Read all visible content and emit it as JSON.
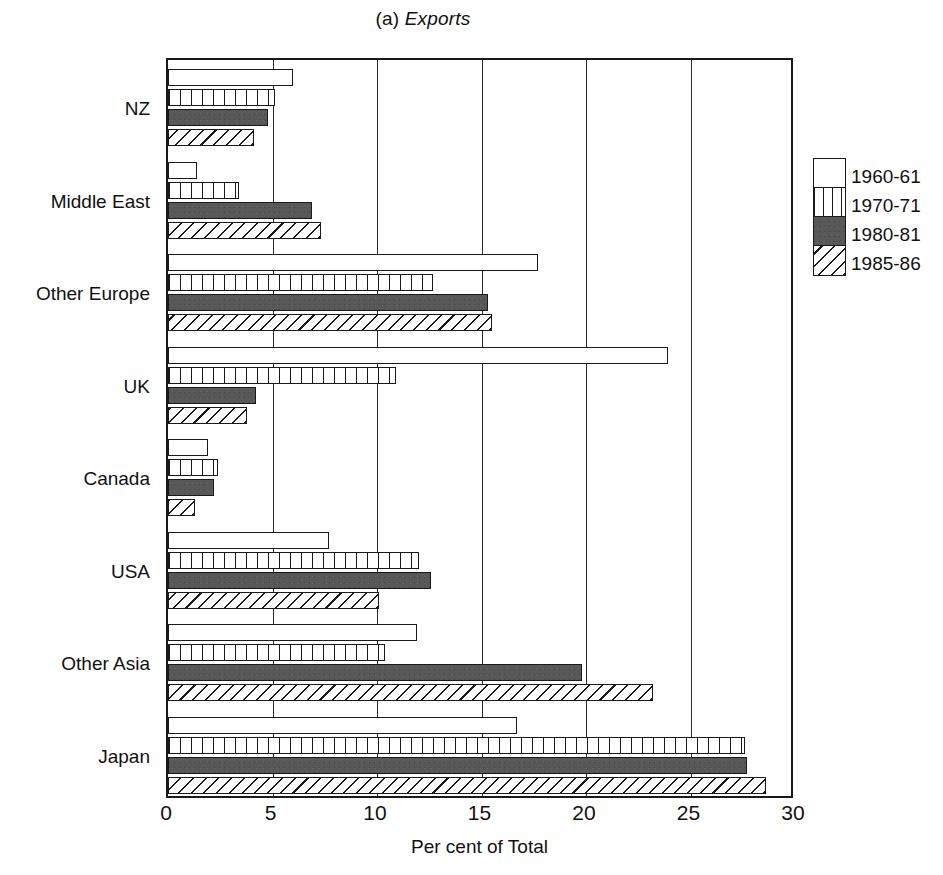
{
  "chart_data": {
    "type": "bar",
    "orientation": "horizontal",
    "title": "(a) Exports",
    "title_prefix": "(a) ",
    "title_emphasis": "Exports",
    "xlabel": "Per cent of Total",
    "ylabel": "",
    "xlim": [
      0,
      30
    ],
    "xticks": [
      0,
      5,
      10,
      15,
      20,
      25,
      30
    ],
    "xtick_labels": [
      "0",
      "5",
      "10",
      "15",
      "20",
      "25",
      "30"
    ],
    "grid": true,
    "grid_axis": "x",
    "legend_position": "right",
    "categories": [
      "NZ",
      "Middle East",
      "Other Europe",
      "UK",
      "Canada",
      "USA",
      "Other Asia",
      "Japan"
    ],
    "series": [
      {
        "name": "1960-61",
        "fill": "solid-white",
        "values": [
          6.0,
          1.4,
          17.7,
          23.9,
          1.9,
          7.7,
          11.9,
          16.7
        ]
      },
      {
        "name": "1970-71",
        "fill": "vertical-stripes",
        "values": [
          5.1,
          3.4,
          12.7,
          10.9,
          2.4,
          12.0,
          10.4,
          27.6
        ]
      },
      {
        "name": "1980-81",
        "fill": "dark-solid",
        "values": [
          4.8,
          6.9,
          15.3,
          4.2,
          2.2,
          12.6,
          19.8,
          27.7
        ]
      },
      {
        "name": "1985-86",
        "fill": "diagonal-hatch",
        "values": [
          4.1,
          7.3,
          15.5,
          3.8,
          1.3,
          10.1,
          23.2,
          28.6
        ]
      }
    ],
    "colors": {
      "ink": "#1a1a1a",
      "dark_fill": "#585858",
      "background": "#ffffff"
    }
  },
  "legend": {
    "entries": [
      "1960-61",
      "1970-71",
      "1980-81",
      "1985-86"
    ]
  }
}
